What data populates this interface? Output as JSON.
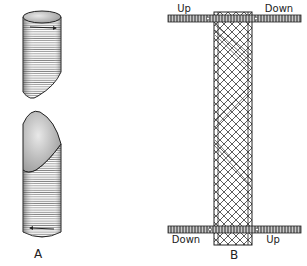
{
  "figure": {
    "panel_a": {
      "label": "A"
    },
    "panel_b": {
      "label": "B",
      "top_left": "Up",
      "top_right": "Down",
      "bottom_left": "Down",
      "bottom_right": "Up"
    }
  },
  "colors": {
    "ink": "#222222",
    "paper": "#ffffff",
    "shade": "#888888"
  }
}
